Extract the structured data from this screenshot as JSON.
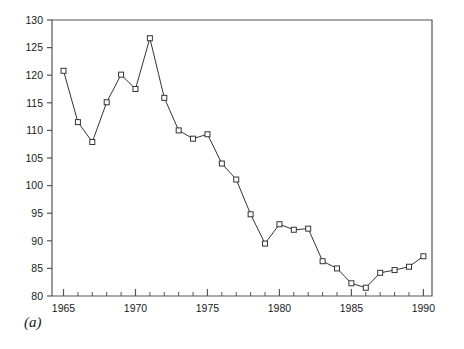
{
  "figure": {
    "panel_label": "(a)",
    "background_color": "#ffffff",
    "line_color": "#333333",
    "marker_face_color": "#ffffff",
    "marker_edge_color": "#333333",
    "axis_color": "#555555"
  },
  "chart_data": {
    "type": "line",
    "title": "",
    "xlabel": "",
    "ylabel": "",
    "xlim": [
      1964.2,
      1990.6
    ],
    "ylim": [
      80,
      130
    ],
    "grid": false,
    "legend": null,
    "marker": "square",
    "xticks_major": [
      1965,
      1970,
      1975,
      1980,
      1985,
      1990
    ],
    "xtick_labels": [
      "1965",
      "1970",
      "1975",
      "1980",
      "1985",
      "1990"
    ],
    "xticks_minor": [
      1966,
      1967,
      1968,
      1969,
      1971,
      1972,
      1973,
      1974,
      1976,
      1977,
      1978,
      1979,
      1981,
      1982,
      1983,
      1984,
      1986,
      1987,
      1988,
      1989
    ],
    "yticks": [
      80,
      85,
      90,
      95,
      100,
      105,
      110,
      115,
      120,
      125,
      130
    ],
    "ytick_labels": [
      "80",
      "85",
      "90",
      "95",
      "100",
      "105",
      "110",
      "115",
      "120",
      "125",
      "130"
    ],
    "x": [
      1965,
      1966,
      1967,
      1968,
      1969,
      1970,
      1971,
      1972,
      1973,
      1974,
      1975,
      1976,
      1977,
      1978,
      1979,
      1980,
      1981,
      1982,
      1983,
      1984,
      1985,
      1986,
      1987,
      1988,
      1989,
      1990
    ],
    "values": [
      120.8,
      111.5,
      107.9,
      115.1,
      120.1,
      117.5,
      126.7,
      115.9,
      110.0,
      108.5,
      109.3,
      104.0,
      101.1,
      94.8,
      89.5,
      93.0,
      92.0,
      92.2,
      86.3,
      85.0,
      82.3,
      81.5,
      84.2,
      84.7,
      85.3,
      87.2
    ],
    "series": [
      {
        "name": "series-a",
        "values": [
          120.8,
          111.5,
          107.9,
          115.1,
          120.1,
          117.5,
          126.7,
          115.9,
          110.0,
          108.5,
          109.3,
          104.0,
          101.1,
          94.8,
          89.5,
          93.0,
          92.0,
          92.2,
          86.3,
          85.0,
          82.3,
          81.5,
          84.2,
          84.7,
          85.3,
          87.2
        ]
      }
    ]
  }
}
